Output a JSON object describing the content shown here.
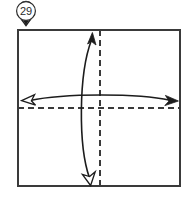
{
  "figure": {
    "step_marker": {
      "icon": "map-pin-icon",
      "number": "29",
      "circle_center": [
        26,
        11
      ],
      "circle_radius": 9.5
    },
    "paper": {
      "shape": "square",
      "x": 18,
      "y": 30,
      "width": 162,
      "height": 156,
      "stroke": "#3a3a3a",
      "fill": "#ffffff",
      "stroke_width": 1.4
    },
    "crease_lines": [
      {
        "name": "vertical-crease",
        "style": "dashed",
        "orientation": "vertical",
        "x": 100,
        "y1": 30,
        "y2": 186,
        "stroke": "#3a3a3a",
        "dash": "6 4"
      },
      {
        "name": "horizontal-crease",
        "style": "dashed",
        "orientation": "horizontal",
        "y": 108,
        "x1": 18,
        "x2": 180,
        "stroke": "#3a3a3a",
        "dash": "6 4"
      }
    ],
    "fold_arrows": [
      {
        "name": "vertical-fold-arrow",
        "orientation": "vertical",
        "bow_direction": "left",
        "path": "M 92 37 C 78 72, 78 146, 90 181",
        "head_start": {
          "type": "solid",
          "at": [
            92,
            37
          ],
          "direction": "up"
        },
        "head_end": {
          "type": "hollow",
          "at": [
            90,
            181
          ],
          "direction": "down"
        },
        "stroke": "#1c1c1c",
        "stroke_width": 1.5
      },
      {
        "name": "horizontal-fold-arrow",
        "orientation": "horizontal",
        "bow_direction": "up",
        "path": "M 26 101 C 62 93, 140 93, 174 101",
        "head_start": {
          "type": "hollow",
          "at": [
            26,
            101
          ],
          "direction": "left"
        },
        "head_end": {
          "type": "solid",
          "at": [
            174,
            101
          ],
          "direction": "right"
        },
        "stroke": "#1c1c1c",
        "stroke_width": 1.5
      }
    ],
    "colors": {
      "ink": "#1c1c1c",
      "line": "#3a3a3a",
      "paper": "#ffffff",
      "marker_fill": "#ffffff",
      "marker_stroke": "#242424"
    }
  }
}
